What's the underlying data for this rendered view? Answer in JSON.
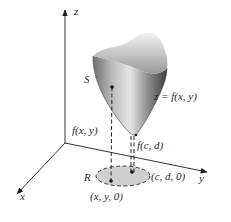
{
  "figure": {
    "axes": {
      "z_label": "z",
      "y_label": "y",
      "x_label": "x"
    },
    "surface": {
      "name_label": "S",
      "equation_label": "z = f(x, y)",
      "fill_light": "#e4e4e4",
      "fill_dark": "#5a5a5a"
    },
    "points": {
      "surface_point_label": "f(x, y)",
      "min_point_label": "f(c, d)",
      "base_point_label": "(x, y, 0)",
      "min_base_label": "(c, d, 0)"
    },
    "region": {
      "label": "R",
      "fill": "#cfcfcf"
    }
  }
}
